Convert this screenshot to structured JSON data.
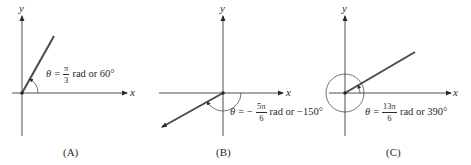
{
  "figure": {
    "panels": [
      {
        "id": "A",
        "caption": "(A)",
        "x_label": "x",
        "y_label": "y",
        "angle_label": {
          "theta": "θ",
          "equals": "=",
          "sign": "",
          "numerator": "π",
          "denominator": "3",
          "unit_text": "rad or 60°"
        },
        "angle_radians": "π/3",
        "angle_degrees": 60,
        "direction": "counterclockwise"
      },
      {
        "id": "B",
        "caption": "(B)",
        "x_label": "x",
        "y_label": "y",
        "angle_label": {
          "theta": "θ",
          "equals": "=",
          "sign": "−",
          "numerator": "5π",
          "denominator": "6",
          "unit_text": "rad or −150°"
        },
        "angle_radians": "-5π/6",
        "angle_degrees": -150,
        "direction": "clockwise"
      },
      {
        "id": "C",
        "caption": "(C)",
        "x_label": "x",
        "y_label": "y",
        "angle_label": {
          "theta": "θ",
          "equals": "=",
          "sign": "",
          "numerator": "13π",
          "denominator": "6",
          "unit_text": "rad or 390°"
        },
        "angle_radians": "13π/6",
        "angle_degrees": 390,
        "direction": "counterclockwise"
      }
    ],
    "colors": {
      "ray": "#4a4a4a",
      "axis": "#3a3a3a",
      "text": "#2a2a2a",
      "background": "#ffffff"
    }
  }
}
